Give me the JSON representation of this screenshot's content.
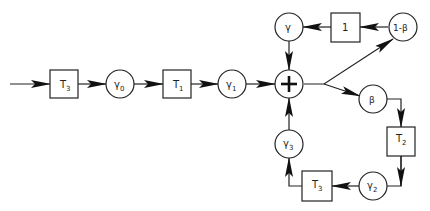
{
  "diagram": {
    "type": "flow-block-diagram",
    "nodes": [
      {
        "id": "T3_in",
        "shape": "box",
        "label": "T",
        "sub": "3"
      },
      {
        "id": "g0",
        "shape": "circle",
        "label": "γ",
        "sub": "0"
      },
      {
        "id": "T1",
        "shape": "box",
        "label": "T",
        "sub": "1"
      },
      {
        "id": "g1",
        "shape": "circle",
        "label": "γ",
        "sub": "1"
      },
      {
        "id": "sum",
        "shape": "circle",
        "label": "+"
      },
      {
        "id": "g",
        "shape": "circle",
        "label": "γ",
        "sub": ""
      },
      {
        "id": "one",
        "shape": "box",
        "label": "1",
        "sub": ""
      },
      {
        "id": "omb",
        "shape": "circle",
        "label": "1-β",
        "sub": ""
      },
      {
        "id": "beta",
        "shape": "circle",
        "label": "β",
        "sub": ""
      },
      {
        "id": "T2",
        "shape": "box",
        "label": "T",
        "sub": "2"
      },
      {
        "id": "g2",
        "shape": "circle",
        "label": "γ",
        "sub": "2"
      },
      {
        "id": "T3_fb",
        "shape": "box",
        "label": "T",
        "sub": "3"
      },
      {
        "id": "g3",
        "shape": "circle",
        "label": "γ",
        "sub": "3"
      }
    ],
    "edges": [
      [
        "input",
        "T3_in"
      ],
      [
        "T3_in",
        "g0"
      ],
      [
        "g0",
        "T1"
      ],
      [
        "T1",
        "g1"
      ],
      [
        "g1",
        "sum"
      ],
      [
        "sum",
        "omb"
      ],
      [
        "sum",
        "beta"
      ],
      [
        "omb",
        "one"
      ],
      [
        "one",
        "g"
      ],
      [
        "g",
        "sum"
      ],
      [
        "beta",
        "T2"
      ],
      [
        "T2",
        "g2"
      ],
      [
        "g2",
        "T3_fb"
      ],
      [
        "T3_fb",
        "g3"
      ],
      [
        "g3",
        "sum"
      ]
    ]
  }
}
